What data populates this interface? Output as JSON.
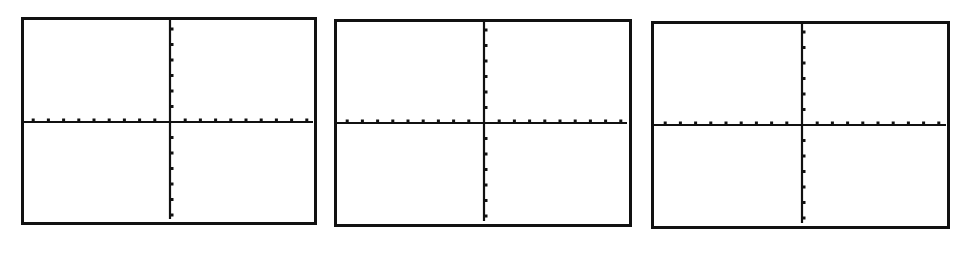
{
  "figure": {
    "line_color": "#111111",
    "background_color": "#ffffff"
  },
  "panels": [
    {
      "id": "graph-1",
      "label": "Blank coordinate grid 1",
      "box": {
        "left": 21,
        "top": 17,
        "width": 296,
        "height": 208
      },
      "axis_origin": {
        "x": 146,
        "y": 102
      },
      "x_axis_right_end": 289,
      "y_axis_bottom_end": 199,
      "x_ticks_left": 9,
      "x_ticks_right": 9,
      "y_ticks_up": 6,
      "y_ticks_down": 6,
      "x_tick_spacing": 15.2,
      "y_tick_spacing": 15.5
    },
    {
      "id": "graph-2",
      "label": "Blank coordinate grid 2",
      "box": {
        "left": 334,
        "top": 19,
        "width": 298,
        "height": 208
      },
      "axis_origin": {
        "x": 147,
        "y": 101
      },
      "x_axis_right_end": 290,
      "y_axis_bottom_end": 199,
      "x_ticks_left": 9,
      "x_ticks_right": 9,
      "y_ticks_up": 6,
      "y_ticks_down": 6,
      "x_tick_spacing": 15.2,
      "y_tick_spacing": 15.5
    },
    {
      "id": "graph-3",
      "label": "Blank coordinate grid 3",
      "box": {
        "left": 651,
        "top": 21,
        "width": 299,
        "height": 208
      },
      "axis_origin": {
        "x": 148,
        "y": 101
      },
      "x_axis_right_end": 292,
      "y_axis_bottom_end": 199,
      "x_ticks_left": 9,
      "x_ticks_right": 9,
      "y_ticks_up": 6,
      "y_ticks_down": 6,
      "x_tick_spacing": 15.2,
      "y_tick_spacing": 15.5
    }
  ]
}
